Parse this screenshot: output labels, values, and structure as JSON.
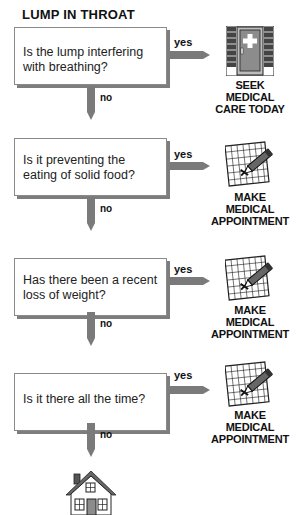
{
  "title": "LUMP IN THROAT",
  "steps": [
    {
      "question": "Is the lump interfering with breathing?",
      "yes_label": "yes",
      "no_label": "no",
      "outcome": {
        "icon": "hospital-door-icon",
        "lines": [
          "SEEK",
          "MEDICAL",
          "CARE TODAY"
        ]
      }
    },
    {
      "question": "Is it preventing the eating of solid food?",
      "yes_label": "yes",
      "no_label": "no",
      "outcome": {
        "icon": "calendar-pencil-icon",
        "lines": [
          "MAKE",
          "MEDICAL",
          "APPOINTMENT"
        ]
      }
    },
    {
      "question": "Has there been a recent loss of weight?",
      "yes_label": "yes",
      "no_label": "no",
      "outcome": {
        "icon": "calendar-pencil-icon",
        "lines": [
          "MAKE",
          "MEDICAL",
          "APPOINTMENT"
        ]
      }
    },
    {
      "question": "Is it there all the time?",
      "yes_label": "yes",
      "no_label": "no",
      "outcome": {
        "icon": "calendar-pencil-icon",
        "lines": [
          "MAKE",
          "MEDICAL",
          "APPOINTMENT"
        ]
      }
    }
  ],
  "final": {
    "icon": "house-icon"
  },
  "colors": {
    "arrow": "#7a7a7a",
    "box_shadow": "#7d7d7d",
    "door": "#8c8c8c"
  }
}
